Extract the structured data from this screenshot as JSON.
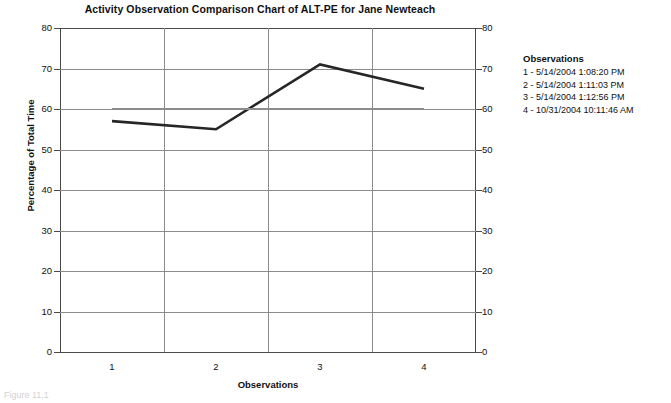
{
  "chart_data": {
    "type": "line",
    "title": "Activity Observation Comparison Chart of ALT-PE for Jane Newteach",
    "xlabel": "Observations",
    "ylabel": "Percentage of Total Time",
    "categories": [
      "1",
      "2",
      "3",
      "4"
    ],
    "x": [
      1,
      2,
      3,
      4
    ],
    "series": [
      {
        "name": "ALT-PE Percentage of Total Time",
        "values": [
          57,
          55,
          71,
          65
        ],
        "color": "#262626",
        "style": "solid",
        "width": 2.6
      },
      {
        "name": "Reference Line",
        "values": [
          60,
          60,
          60,
          60
        ],
        "color": "#8c8c8c",
        "style": "solid",
        "width": 2.2
      }
    ],
    "ylim": [
      0,
      80
    ],
    "ytick_step": 10,
    "yticks": [
      0,
      10,
      20,
      30,
      40,
      50,
      60,
      70,
      80
    ],
    "ytick_labels_left": [
      "0",
      "10",
      "20",
      "30",
      "40",
      "50",
      "60",
      "70",
      "80"
    ],
    "ytick_labels_right": [
      "0",
      "10",
      "20",
      "30",
      "40",
      "50",
      "60",
      "70",
      "80"
    ],
    "xticks": [
      1,
      2,
      3,
      4
    ],
    "xtick_labels": [
      "1",
      "2",
      "3",
      "4"
    ],
    "grid": "horizontal-and-vertical",
    "legend_position": "right",
    "dual_y_axis": true
  },
  "legend": {
    "title": "Observations",
    "entries": [
      "1 - 5/14/2004 1:08:20 PM",
      "2 - 5/14/2004 1:11:03 PM",
      "3 - 5/14/2004 1:12:56 PM",
      "4 - 10/31/2004 10:11:46 AM"
    ]
  },
  "caption": {
    "text": "Figure 11.1"
  }
}
